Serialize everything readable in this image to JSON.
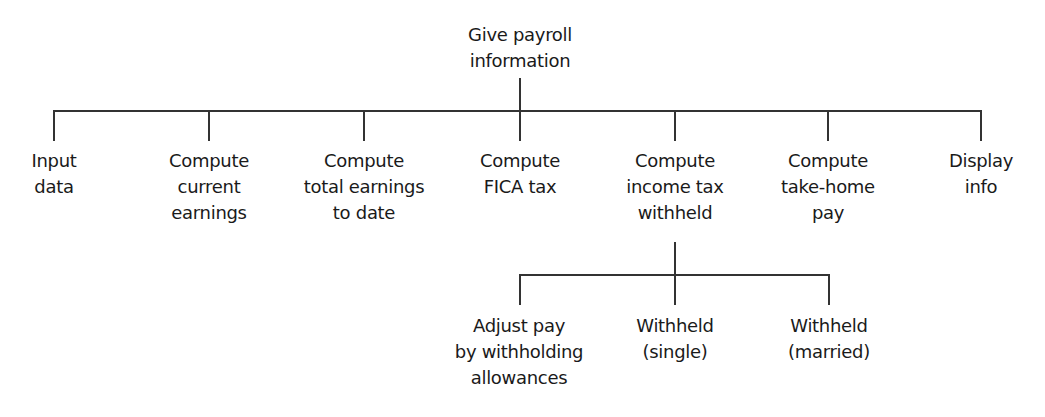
{
  "diagram": {
    "type": "hierarchy-chart",
    "root": {
      "label": "Give payroll\ninformation"
    },
    "level1": [
      {
        "label": "Input\ndata"
      },
      {
        "label": "Compute\ncurrent\nearnings"
      },
      {
        "label": "Compute\ntotal earnings\nto date"
      },
      {
        "label": "Compute\nFICA tax"
      },
      {
        "label": "Compute\nincome tax\nwithheld"
      },
      {
        "label": "Compute\ntake-home\npay"
      },
      {
        "label": "Display\ninfo"
      }
    ],
    "level2_parent": "Compute income tax withheld",
    "level2": [
      {
        "label": "Adjust pay\nby withholding\nallowances"
      },
      {
        "label": "Withheld\n(single)"
      },
      {
        "label": "Withheld\n(married)"
      }
    ]
  }
}
